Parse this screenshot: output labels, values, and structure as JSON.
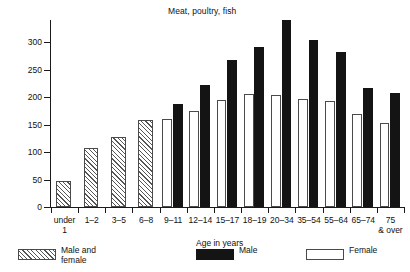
{
  "chart_data": {
    "type": "bar",
    "title": "Meat, poultry, fish",
    "xlabel": "Age in years",
    "ylabel": "Grams",
    "ylim": [
      0,
      340
    ],
    "yticks": [
      0,
      50,
      100,
      150,
      200,
      250,
      300
    ],
    "ytick_labels": [
      "0",
      "50",
      "100",
      "150",
      "200",
      "250",
      "300"
    ],
    "grid": false,
    "legend_position": "bottom",
    "categories": [
      "under 1",
      "1–2",
      "3–5",
      "6–8",
      "9–11",
      "12–14",
      "15–17",
      "18–19",
      "20–34",
      "35–54",
      "55–64",
      "65–74",
      "75 & over"
    ],
    "category_lines": [
      [
        "under",
        "1"
      ],
      [
        "1–2",
        ""
      ],
      [
        "3–5",
        ""
      ],
      [
        "6–8",
        ""
      ],
      [
        "9–11",
        ""
      ],
      [
        "12–14",
        ""
      ],
      [
        "15–17",
        ""
      ],
      [
        "18–19",
        ""
      ],
      [
        "20–34",
        ""
      ],
      [
        "35–54",
        ""
      ],
      [
        "55–64",
        ""
      ],
      [
        "65–74",
        ""
      ],
      [
        "75",
        "& over"
      ]
    ],
    "series": [
      {
        "name": "Male and female",
        "fill": "hatch",
        "values": [
          48,
          107,
          127,
          159,
          null,
          null,
          null,
          null,
          null,
          null,
          null,
          null,
          null
        ]
      },
      {
        "name": "Female",
        "fill": "white",
        "values": [
          null,
          null,
          null,
          null,
          160,
          175,
          195,
          205,
          203,
          196,
          193,
          170,
          152
        ]
      },
      {
        "name": "Male",
        "fill": "black",
        "values": [
          null,
          null,
          null,
          null,
          188,
          222,
          268,
          291,
          340,
          303,
          281,
          216,
          207
        ]
      }
    ]
  },
  "legend": {
    "items": [
      {
        "label_line1": "Male and",
        "label_line2": "female",
        "fill": "hatch"
      },
      {
        "label_line1": "Male",
        "label_line2": "",
        "fill": "black"
      },
      {
        "label_line1": "Female",
        "label_line2": "",
        "fill": "white"
      }
    ]
  },
  "colors": {
    "bar_black": "#141414",
    "bar_white": "#ffffff",
    "bar_outline": "#4a4a4a",
    "axis": "#1a1a1a",
    "text": "#111111",
    "background": "#ffffff"
  }
}
